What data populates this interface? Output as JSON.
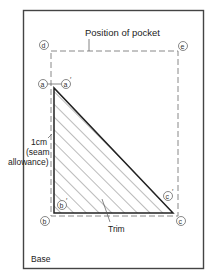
{
  "diagram": {
    "title_label": "Position of pocket",
    "base_label": "Base",
    "trim_label": "Trim",
    "seam_label_lines": [
      "1cm",
      "(seam",
      "allowance)"
    ],
    "points": {
      "a": "a",
      "a_prime": "a",
      "b": "b",
      "b_prime": "b",
      "c": "c",
      "c_prime": "c",
      "d": "d",
      "e": "e"
    },
    "prime_mark": "′",
    "colors": {
      "frame": "#444444",
      "dashed": "#888888",
      "triangle": "#222222",
      "hatch": "#555555",
      "text": "#222222"
    }
  }
}
